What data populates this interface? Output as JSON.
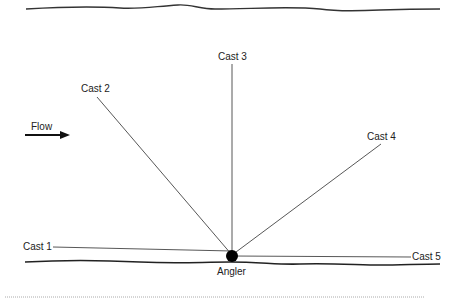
{
  "diagram": {
    "flow_label": "Flow",
    "angler_label": "Angler",
    "casts": [
      {
        "label": "Cast 1"
      },
      {
        "label": "Cast 2"
      },
      {
        "label": "Cast 3"
      },
      {
        "label": "Cast 4"
      },
      {
        "label": "Cast 5"
      }
    ],
    "colors": {
      "line": "#333333",
      "bank": "#222222",
      "angler": "#000000",
      "border": "#999999"
    }
  }
}
